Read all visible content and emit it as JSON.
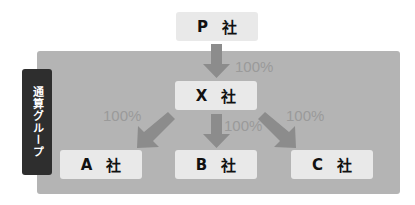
{
  "group": {
    "label": "通算グループ"
  },
  "companies": {
    "p": {
      "letter": "P",
      "suffix": "社"
    },
    "x": {
      "letter": "X",
      "suffix": "社"
    },
    "a": {
      "letter": "A",
      "suffix": "社"
    },
    "b": {
      "letter": "B",
      "suffix": "社"
    },
    "c": {
      "letter": "C",
      "suffix": "社"
    }
  },
  "ownership": {
    "p_to_x": "100%",
    "x_to_a": "100%",
    "x_to_b": "100%",
    "x_to_c": "100%"
  },
  "colors": {
    "group_area": "#b4b4b4",
    "group_label_bg": "#2e2e2e",
    "box_bg": "#e9e9e9",
    "arrow": "#8c8c8c",
    "percent_text": "#9a9a9a"
  }
}
